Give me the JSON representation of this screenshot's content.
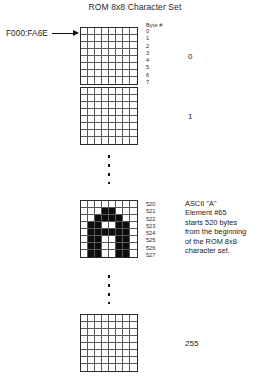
{
  "figure": {
    "title": "ROM 8x8 Character Set",
    "address_label": "F000:FA6E",
    "arrow_icon": "right-arrow-icon",
    "byte_header": "Byte #"
  },
  "elements": [
    {
      "index_label": "0",
      "byte_numbers": [
        "0",
        "1",
        "2",
        "3",
        "4",
        "5",
        "6",
        "7"
      ],
      "bitmap": [
        [
          0,
          0,
          0,
          0,
          0,
          0,
          0,
          0
        ],
        [
          0,
          0,
          0,
          0,
          0,
          0,
          0,
          0
        ],
        [
          0,
          0,
          0,
          0,
          0,
          0,
          0,
          0
        ],
        [
          0,
          0,
          0,
          0,
          0,
          0,
          0,
          0
        ],
        [
          0,
          0,
          0,
          0,
          0,
          0,
          0,
          0
        ],
        [
          0,
          0,
          0,
          0,
          0,
          0,
          0,
          0
        ],
        [
          0,
          0,
          0,
          0,
          0,
          0,
          0,
          0
        ],
        [
          0,
          0,
          0,
          0,
          0,
          0,
          0,
          0
        ]
      ]
    },
    {
      "index_label": "1",
      "byte_numbers": [],
      "bitmap": [
        [
          0,
          0,
          0,
          0,
          0,
          0,
          0,
          0
        ],
        [
          0,
          0,
          0,
          0,
          0,
          0,
          0,
          0
        ],
        [
          0,
          0,
          0,
          0,
          0,
          0,
          0,
          0
        ],
        [
          0,
          0,
          0,
          0,
          0,
          0,
          0,
          0
        ],
        [
          0,
          0,
          0,
          0,
          0,
          0,
          0,
          0
        ],
        [
          0,
          0,
          0,
          0,
          0,
          0,
          0,
          0
        ],
        [
          0,
          0,
          0,
          0,
          0,
          0,
          0,
          0
        ],
        [
          0,
          0,
          0,
          0,
          0,
          0,
          0,
          0
        ]
      ]
    },
    {
      "index_label": "",
      "byte_numbers": [
        "520",
        "521",
        "522",
        "523",
        "524",
        "525",
        "526",
        "527"
      ],
      "bitmap": [
        [
          0,
          0,
          0,
          0,
          0,
          0,
          0,
          0
        ],
        [
          0,
          0,
          0,
          1,
          1,
          0,
          0,
          0
        ],
        [
          0,
          0,
          1,
          1,
          1,
          1,
          0,
          0
        ],
        [
          0,
          1,
          1,
          0,
          0,
          1,
          1,
          0
        ],
        [
          0,
          1,
          1,
          1,
          1,
          1,
          1,
          0
        ],
        [
          0,
          1,
          1,
          0,
          0,
          1,
          1,
          0
        ],
        [
          0,
          1,
          1,
          0,
          0,
          1,
          1,
          0
        ],
        [
          0,
          1,
          1,
          0,
          0,
          1,
          1,
          0
        ]
      ],
      "annotation": [
        "ASCII \"A\"",
        "Element #65",
        "starts 520 bytes",
        "from the beginning",
        "of the ROM 8x8",
        "character set."
      ]
    },
    {
      "index_label": "255",
      "byte_numbers": [],
      "bitmap": [
        [
          0,
          0,
          0,
          0,
          0,
          0,
          0,
          0
        ],
        [
          0,
          0,
          0,
          0,
          0,
          0,
          0,
          0
        ],
        [
          0,
          0,
          0,
          0,
          0,
          0,
          0,
          0
        ],
        [
          0,
          0,
          0,
          0,
          0,
          0,
          0,
          0
        ],
        [
          0,
          0,
          0,
          0,
          0,
          0,
          0,
          0
        ],
        [
          0,
          0,
          0,
          0,
          0,
          0,
          0,
          0
        ],
        [
          0,
          0,
          0,
          0,
          0,
          0,
          0,
          0
        ],
        [
          0,
          0,
          0,
          0,
          0,
          0,
          0,
          0
        ]
      ]
    }
  ],
  "ellipses": {
    "top_dot_count": 4,
    "bottom_dot_count": 4
  },
  "colors": {
    "ink": "#0c0c0c",
    "grid_line": "#5a5a5a",
    "grid_border": "#2b2b2b",
    "background": "#ffffff"
  }
}
